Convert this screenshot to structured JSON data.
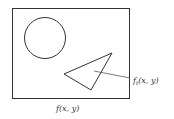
{
  "diagram": {
    "frame_label": "f(x, y)",
    "target_label_base": "f",
    "target_label_sub": "t",
    "target_label_args": "(x, y)",
    "shapes": [
      "circle",
      "triangle"
    ],
    "colors": {
      "stroke": "#333333",
      "background": "#ffffff"
    }
  }
}
